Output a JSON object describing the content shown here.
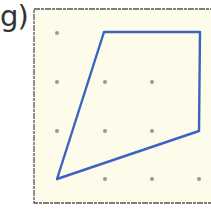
{
  "figure": {
    "label": "g)",
    "background_color": "#fdfbe9",
    "frame_color": "#555555",
    "dot_color": "#9a9a8a",
    "shape_color": "#3a63c4",
    "grid": {
      "columns": 4,
      "rows": 4,
      "dots": [
        [
          0,
          0
        ],
        [
          0,
          1
        ],
        [
          1,
          1
        ],
        [
          2,
          1
        ],
        [
          0,
          2
        ],
        [
          1,
          2
        ],
        [
          2,
          2
        ],
        [
          1,
          3
        ],
        [
          2,
          3
        ],
        [
          3,
          3
        ]
      ]
    },
    "polygon": {
      "type": "quadrilateral",
      "vertices_grid": [
        [
          1,
          0
        ],
        [
          3,
          0
        ],
        [
          3,
          2
        ],
        [
          0,
          3
        ]
      ]
    }
  }
}
